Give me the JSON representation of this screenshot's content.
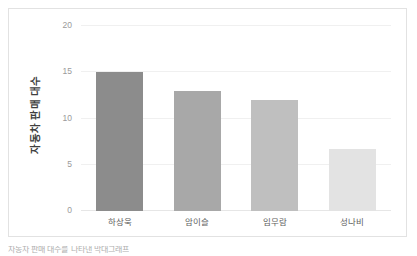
{
  "chart_data": {
    "type": "bar",
    "title": "",
    "subtitle": "",
    "xlabel": "",
    "ylabel": "자동차 판매 대수",
    "categories": [
      "하상욱",
      "암이슬",
      "임무람",
      "성나비"
    ],
    "values": [
      15,
      13,
      12,
      6.7
    ],
    "series": [
      {
        "name": "자동차 판매 대수",
        "values": [
          15,
          13,
          12,
          6.7
        ]
      }
    ],
    "bar_colors": [
      "#8c8c8c",
      "#a8a8a8",
      "#bfbfbf",
      "#e3e3e3"
    ],
    "ylim": [
      0,
      20
    ],
    "yticks": [
      0,
      5,
      10,
      15,
      20
    ],
    "ytick_labels": [
      "0",
      "5",
      "10",
      "15",
      "20"
    ],
    "grid": true,
    "grid_color": "#f0f0f0",
    "legend": false,
    "legend_position": "none",
    "orientation": "vertical",
    "plot_background": "#ffffff",
    "frame_border_color": "#e2e2e2"
  },
  "caption": {
    "text": "자동차 판매 대수를 나타낸 막대그래프"
  }
}
